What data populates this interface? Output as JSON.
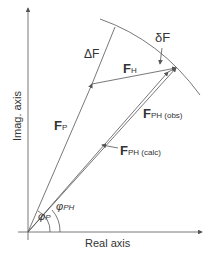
{
  "labels": {
    "delta_F_big": "ΔF",
    "delta_F_small": "δF",
    "F_H": "F",
    "F_H_sub": "H",
    "F_P": "F",
    "F_P_sub": "P",
    "F_PH_obs": "F",
    "F_PH_obs_sub": "PH (obs)",
    "F_PH_calc": "F",
    "F_PH_calc_sub": "PH (calc)",
    "phi_P": "φ",
    "phi_P_sub": "P",
    "phi_PH": "φ",
    "phi_PH_sub": "PH",
    "x_axis": "Real axis",
    "y_axis": "Imag. axis"
  },
  "colors": {
    "line": "#555555"
  }
}
